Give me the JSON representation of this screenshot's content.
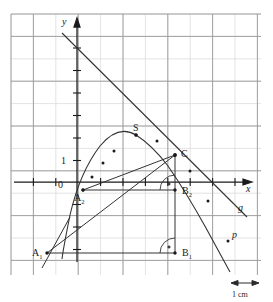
{
  "figure": {
    "axes": {
      "x_label": "x",
      "y_label": "y",
      "x_axis_y_px": 182,
      "y_axis_x_px": 77,
      "unit_tick_label": "1",
      "origin_label": "0"
    },
    "grid": {
      "x0": 11,
      "y0": 14,
      "x1": 261,
      "y1": 275,
      "step": 22.4,
      "minor_color": "#d9d9d9",
      "major_color": "#8c8c8c",
      "major_every": 2
    },
    "scale_bar": {
      "label": "1 cm",
      "length_px": 22
    },
    "colors": {
      "ink": "#1a1a1a",
      "curve": "#333333",
      "grid_minor": "#d9d9d9",
      "grid_major": "#8c8c8c",
      "background": "#ffffff"
    },
    "point_labels": [
      {
        "name": "S",
        "text": "S",
        "sub": "",
        "x": 136,
        "y": 135,
        "lx": 133,
        "ly": 131
      },
      {
        "name": "C",
        "text": "C",
        "sub": "",
        "x": 175,
        "y": 155,
        "lx": 181,
        "ly": 157
      },
      {
        "name": "A1",
        "text": "A",
        "sub": "1",
        "x": 47,
        "y": 253,
        "lx": 32,
        "ly": 256
      },
      {
        "name": "A2",
        "text": "A",
        "sub": "2",
        "x": 83,
        "y": 190,
        "lx": 74,
        "ly": 201
      },
      {
        "name": "B1",
        "text": "B",
        "sub": "1",
        "x": 175,
        "y": 253,
        "lx": 182,
        "ly": 256
      },
      {
        "name": "B2",
        "text": "B",
        "sub": "2",
        "x": 175,
        "y": 190,
        "lx": 182,
        "ly": 194
      }
    ],
    "curve_labels": [
      {
        "name": "g",
        "text": "g",
        "x": 238,
        "y": 211
      },
      {
        "name": "p",
        "text": "p",
        "x": 232,
        "y": 238
      }
    ],
    "marked_points": [
      {
        "x": 83,
        "y": 190
      },
      {
        "x": 92,
        "y": 177
      },
      {
        "x": 103,
        "y": 163
      },
      {
        "x": 114,
        "y": 151
      },
      {
        "x": 136,
        "y": 135
      },
      {
        "x": 157,
        "y": 141
      },
      {
        "x": 175,
        "y": 155
      },
      {
        "x": 190,
        "y": 171
      },
      {
        "x": 208,
        "y": 201
      },
      {
        "x": 228,
        "y": 241
      }
    ],
    "right_angle_marks": [
      {
        "name": "right-angle-b1",
        "x": 175,
        "y": 253
      },
      {
        "name": "right-angle-b2",
        "x": 175,
        "y": 190
      }
    ]
  }
}
